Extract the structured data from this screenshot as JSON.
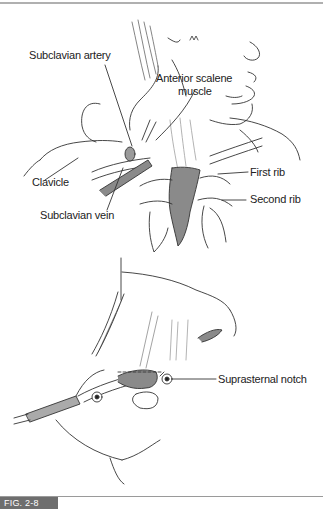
{
  "figure": {
    "tag": "FIG. 2-8",
    "top_panel": {
      "labels": {
        "subclavian_artery": "Subclavian artery",
        "anterior_scalene_1": "Anterior scalene",
        "anterior_scalene_2": "muscle",
        "clavicle": "Clavicle",
        "subclavian_vein": "Subclavian vein",
        "first_rib": "First rib",
        "second_rib": "Second rib"
      }
    },
    "bottom_panel": {
      "labels": {
        "suprasternal_notch": "Suprasternal notch"
      }
    },
    "colors": {
      "line": "#333333",
      "shade": "#8a8a8a",
      "tag_bg": "#6e6e6e",
      "rule": "#b0b0b0"
    }
  }
}
